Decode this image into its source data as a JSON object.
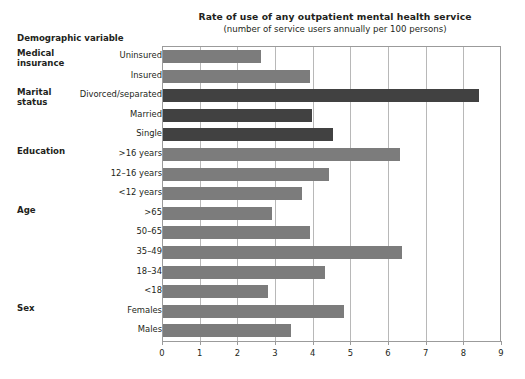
{
  "header": {
    "column_header": "Demographic variable"
  },
  "chart_data": {
    "type": "bar",
    "orientation": "horizontal",
    "title": "Rate of use of any outpatient mental health service",
    "subtitle": "(number of service users annually per 100 persons)",
    "xlabel": "",
    "ylabel": "Demographic variable",
    "xlim": [
      0,
      9
    ],
    "xticks": [
      0,
      1,
      2,
      3,
      4,
      5,
      6,
      7,
      8,
      9
    ],
    "xtick_labels": [
      "0",
      "1",
      "2",
      "3",
      "4",
      "5",
      "6",
      "7",
      "8",
      "9"
    ],
    "grid": "vertical",
    "legend": "none",
    "colors": {
      "light_gray": "#7c7c7c",
      "dark_gray": "#414141",
      "gridline": "#b8b8b8",
      "axis": "#9b9b9b",
      "text": "#231f20",
      "background": "#ffffff"
    },
    "groups": [
      {
        "name": "Medical\ninsurance",
        "color_key": "light_gray",
        "categories": [
          "Uninsured",
          "Insured"
        ],
        "values": [
          2.6,
          3.9
        ]
      },
      {
        "name": "Marital\nstatus",
        "color_key": "dark_gray",
        "categories": [
          "Divorced/separated",
          "Married",
          "Single"
        ],
        "values": [
          8.4,
          3.95,
          4.5
        ]
      },
      {
        "name": "Education",
        "color_key": "light_gray",
        "categories": [
          ">16 years",
          "12–16 years",
          "<12 years"
        ],
        "values": [
          6.3,
          4.4,
          3.7
        ]
      },
      {
        "name": "Age",
        "color_key": "light_gray",
        "categories": [
          ">65",
          "50–65",
          "35–49",
          "18–34",
          "<18"
        ],
        "values": [
          2.9,
          3.9,
          6.35,
          4.3,
          2.8
        ]
      },
      {
        "name": "Sex",
        "color_key": "light_gray",
        "categories": [
          "Females",
          "Males"
        ],
        "values": [
          4.8,
          3.4
        ]
      }
    ],
    "bars": [
      {
        "label": "Uninsured",
        "value": 2.6,
        "group": "Medical insurance",
        "color_key": "light_gray"
      },
      {
        "label": "Insured",
        "value": 3.9,
        "group": "Medical insurance",
        "color_key": "light_gray"
      },
      {
        "label": "Divorced/separated",
        "value": 8.4,
        "group": "Marital status",
        "color_key": "dark_gray"
      },
      {
        "label": "Married",
        "value": 3.95,
        "group": "Marital status",
        "color_key": "dark_gray"
      },
      {
        "label": "Single",
        "value": 4.5,
        "group": "Marital status",
        "color_key": "dark_gray"
      },
      {
        "label": ">16 years",
        "value": 6.3,
        "group": "Education",
        "color_key": "light_gray"
      },
      {
        "label": "12–16 years",
        "value": 4.4,
        "group": "Education",
        "color_key": "light_gray"
      },
      {
        "label": "<12 years",
        "value": 3.7,
        "group": "Education",
        "color_key": "light_gray"
      },
      {
        "label": ">65",
        "value": 2.9,
        "group": "Age",
        "color_key": "light_gray"
      },
      {
        "label": "50–65",
        "value": 3.9,
        "group": "Age",
        "color_key": "light_gray"
      },
      {
        "label": "35–49",
        "value": 6.35,
        "group": "Age",
        "color_key": "light_gray"
      },
      {
        "label": "18–34",
        "value": 4.3,
        "group": "Age",
        "color_key": "light_gray"
      },
      {
        "label": "<18",
        "value": 2.8,
        "group": "Age",
        "color_key": "light_gray"
      },
      {
        "label": "Females",
        "value": 4.8,
        "group": "Sex",
        "color_key": "light_gray"
      },
      {
        "label": "Males",
        "value": 3.4,
        "group": "Sex",
        "color_key": "light_gray"
      }
    ],
    "group_title_rows": [
      {
        "name": "Medical\ninsurance",
        "first_bar_index": 0
      },
      {
        "name": "Marital\nstatus",
        "first_bar_index": 2
      },
      {
        "name": "Education",
        "first_bar_index": 5
      },
      {
        "name": "Age",
        "first_bar_index": 8
      },
      {
        "name": "Sex",
        "first_bar_index": 13
      }
    ]
  }
}
